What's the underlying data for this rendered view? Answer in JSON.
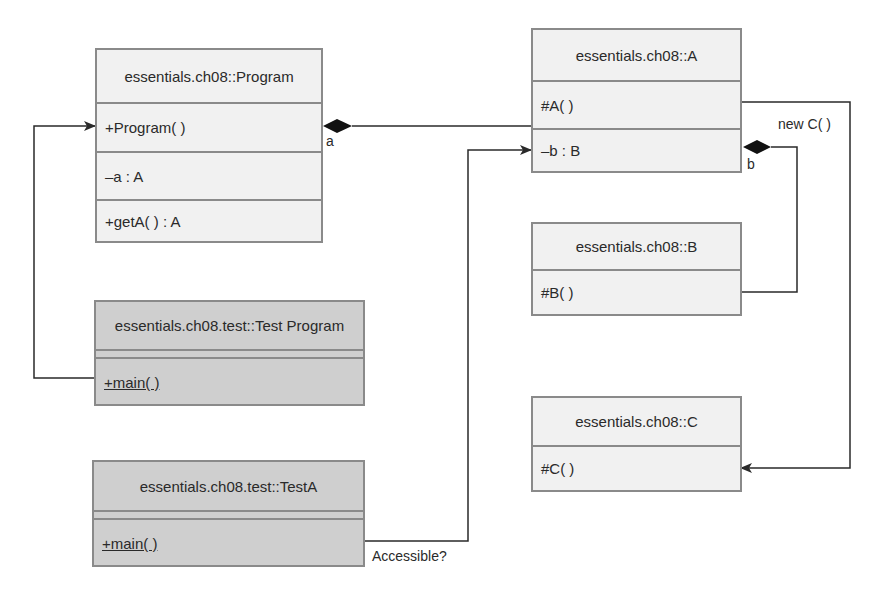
{
  "diagram": {
    "type": "UML class diagram",
    "classes": [
      {
        "id": "program",
        "name": "essentials.ch08::Program",
        "members": [
          "+Program( )",
          "–a : A",
          "+getA( ) : A"
        ]
      },
      {
        "id": "a",
        "name": "essentials.ch08::A",
        "members": [
          "#A( )",
          "–b : B"
        ]
      },
      {
        "id": "b",
        "name": "essentials.ch08::B",
        "members": [
          "#B( )"
        ]
      },
      {
        "id": "c",
        "name": "essentials.ch08::C",
        "members": [
          "#C( )"
        ]
      },
      {
        "id": "test_program",
        "name": "essentials.ch08.test::Test Program",
        "members": [
          "+main( )"
        ],
        "fill": "#cfcfcf"
      },
      {
        "id": "test_a",
        "name": "essentials.ch08.test::TestA",
        "members": [
          "+main( )"
        ],
        "fill": "#cfcfcf"
      }
    ],
    "relationships": [
      {
        "from": "program",
        "to": "a",
        "kind": "composition",
        "role": "a"
      },
      {
        "from": "a",
        "to": "b",
        "kind": "composition",
        "role": "b"
      },
      {
        "from": "a",
        "to": "c",
        "kind": "dependency",
        "label": "new C( )"
      },
      {
        "from": "test_program",
        "to": "program",
        "kind": "dependency"
      },
      {
        "from": "test_a",
        "to": "a",
        "kind": "dependency",
        "label": "Accessible?"
      }
    ],
    "labels": {
      "role_a": "a",
      "role_b": "b",
      "new_c": "new C( )",
      "accessible": "Accessible?"
    },
    "colors": {
      "class_fill": "#f1f1f1",
      "test_class_fill": "#cfcfcf",
      "border": "#8a8a8a",
      "line": "#2a2a2a"
    }
  }
}
